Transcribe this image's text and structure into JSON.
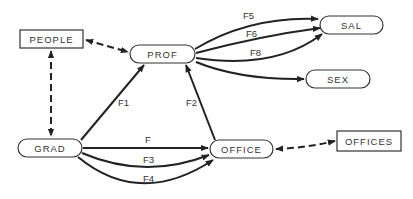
{
  "diagram": {
    "type": "directed-graph",
    "nodes": {
      "people": {
        "label": "PEOPLE",
        "shape": "rectangle"
      },
      "prof": {
        "label": "PROF",
        "shape": "pill"
      },
      "sal": {
        "label": "SAL",
        "shape": "pill"
      },
      "sex": {
        "label": "SEX",
        "shape": "pill"
      },
      "grad": {
        "label": "GRAD",
        "shape": "pill"
      },
      "office": {
        "label": "OFFICE",
        "shape": "pill"
      },
      "offices": {
        "label": "OFFICES",
        "shape": "rectangle"
      }
    },
    "edges": {
      "f5": {
        "label": "F5",
        "from": "PROF",
        "to": "SAL",
        "style": "solid"
      },
      "f6": {
        "label": "F6",
        "from": "PROF",
        "to": "SAL",
        "style": "solid"
      },
      "f8": {
        "label": "F8",
        "from": "PROF",
        "to": "SAL",
        "style": "solid"
      },
      "prof_sex": {
        "label": "",
        "from": "PROF",
        "to": "SEX",
        "style": "solid"
      },
      "f1": {
        "label": "F1",
        "from": "GRAD",
        "to": "PROF",
        "style": "solid"
      },
      "f2": {
        "label": "F2",
        "from": "OFFICE",
        "to": "PROF",
        "style": "solid"
      },
      "f": {
        "label": "F",
        "from": "GRAD",
        "to": "OFFICE",
        "style": "solid"
      },
      "f3": {
        "label": "F3",
        "from": "GRAD",
        "to": "OFFICE",
        "style": "solid"
      },
      "f4": {
        "label": "F4",
        "from": "GRAD",
        "to": "OFFICE",
        "style": "solid"
      },
      "people_prof": {
        "label": "",
        "from": "PEOPLE",
        "to": "PROF",
        "style": "dashed-bidirectional"
      },
      "people_grad": {
        "label": "",
        "from": "PEOPLE",
        "to": "GRAD",
        "style": "dashed-bidirectional"
      },
      "office_offices": {
        "label": "",
        "from": "OFFICE",
        "to": "OFFICES",
        "style": "dashed-bidirectional"
      }
    }
  }
}
